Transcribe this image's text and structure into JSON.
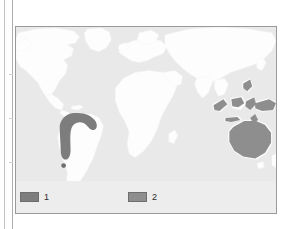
{
  "figure": {
    "frame": {
      "border_color": "#9a9a9a",
      "background_color": "#e9e9e9"
    },
    "map": {
      "ocean_color": "#e9e9e9",
      "land_color": "#fdfdfd",
      "land_outline_color": "#f2f2f2",
      "projection_note": "world map, equirectangular, centred on Africa"
    },
    "distribution": {
      "region_1_color": "#7d7d7d",
      "region_2_color": "#8e8e8e",
      "regions": [
        {
          "key": "1",
          "name": "northwestern-south-america",
          "description": "hook shaped range across Colombia, Venezuela, Ecuador and northern Peru, plus an isolated point to the south",
          "color": "#7d7d7d"
        },
        {
          "key": "2",
          "name": "australasia",
          "description": "Australia with outliers across New Guinea, Sulawesi, Borneo and the Philippines",
          "color": "#8e8e8e"
        }
      ]
    },
    "legend": {
      "background_color": "#ededed",
      "items": [
        {
          "label": "1",
          "swatch_color": "#7d7d7d",
          "swatch_border": "#6e6e6e"
        },
        {
          "label": "2",
          "swatch_color": "#8e8e8e",
          "swatch_border": "#6e6e6e"
        }
      ]
    }
  }
}
